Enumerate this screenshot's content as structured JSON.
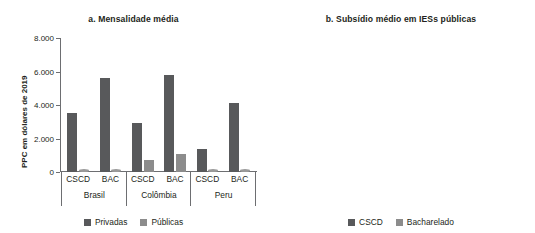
{
  "figure": {
    "ylabel": "PPC em dólares de 2019",
    "colors": {
      "dark": "#58595b",
      "light": "#8c8c8c",
      "axis": "#6d6e71",
      "text": "#231f20",
      "background": "#ffffff"
    }
  },
  "panel_a": {
    "title": "a. Mensalidade média",
    "ylabel": "PPC em dólares de 2019",
    "legend": [
      {
        "label": "Privadas",
        "color": "#58595b"
      },
      {
        "label": "Públicas",
        "color": "#8c8c8c"
      }
    ],
    "groups": [
      {
        "label": "Brasil"
      },
      {
        "label": "Colômbia"
      },
      {
        "label": "Peru"
      }
    ],
    "subcategories": [
      "CSCD",
      "BAC",
      "CSCD",
      "BAC",
      "CSCD",
      "BAC"
    ],
    "ticks": [
      "0",
      "2.000",
      "4.000",
      "6.000",
      "8.000"
    ]
  },
  "panel_b": {
    "title": "b. Subsídio médio em IESs públicas",
    "ylabel": "PPC em dólares de 2019",
    "legend": [
      {
        "label": "CSCD",
        "color": "#58595b"
      },
      {
        "label": "Bacharelado",
        "color": "#8c8c8c"
      }
    ],
    "groups": [
      {
        "label": "Brasil"
      },
      {
        "label": "Colômbia"
      },
      {
        "label": "Peru"
      }
    ],
    "ticks": [
      "0",
      "2.000",
      "4.000",
      "6.000"
    ]
  },
  "chart_data": [
    {
      "type": "bar",
      "title": "a. Mensalidade média",
      "xlabel": "",
      "ylabel": "PPC em dólares de 2019",
      "ylim": [
        0,
        8000
      ],
      "yticks": [
        0,
        2000,
        4000,
        6000,
        8000
      ],
      "ytick_labels": [
        "0",
        "2.000",
        "4.000",
        "6.000",
        "8.000"
      ],
      "grid": false,
      "legend_position": "bottom",
      "categories": [
        "Brasil - CSCD",
        "Brasil - BAC",
        "Colômbia - CSCD",
        "Colômbia - BAC",
        "Peru - CSCD",
        "Peru - BAC"
      ],
      "series": [
        {
          "name": "Privadas",
          "color": "#58595b",
          "values": [
            3500,
            5600,
            2900,
            5800,
            1400,
            4150
          ]
        },
        {
          "name": "Públicas",
          "color": "#8c8c8c",
          "values": [
            0,
            0,
            700,
            1100,
            0,
            0
          ]
        }
      ]
    },
    {
      "type": "bar",
      "title": "b. Subsídio médio em IESs públicas",
      "xlabel": "",
      "ylabel": "PPC em dólares de 2019",
      "ylim": [
        0,
        6000
      ],
      "yticks": [
        0,
        2000,
        4000,
        6000
      ],
      "ytick_labels": [
        "0",
        "2.000",
        "4.000",
        "6.000"
      ],
      "grid": false,
      "legend_position": "bottom",
      "categories": [
        "Brasil",
        "Colômbia",
        "Peru"
      ],
      "series": [
        {
          "name": "CSCD",
          "color": "#58595b",
          "values": [
            3500,
            2200,
            1400
          ]
        },
        {
          "name": "Bacharelado",
          "color": "#8c8c8c",
          "values": [
            5650,
            4650,
            4150
          ]
        }
      ]
    }
  ]
}
